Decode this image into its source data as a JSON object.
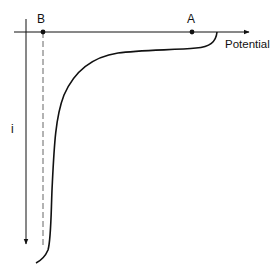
{
  "diagram": {
    "type": "current-potential curve",
    "x_axis": {
      "label": "Potential",
      "direction": "right"
    },
    "y_axis": {
      "label": "i",
      "direction": "down"
    },
    "points": [
      {
        "label": "A",
        "description": "point on potential axis near plateau start"
      },
      {
        "label": "B",
        "description": "point on potential axis with dashed vertical asymptote"
      }
    ],
    "colors": {
      "stroke": "#111111",
      "dashed": "#666666",
      "background": "#ffffff"
    }
  }
}
